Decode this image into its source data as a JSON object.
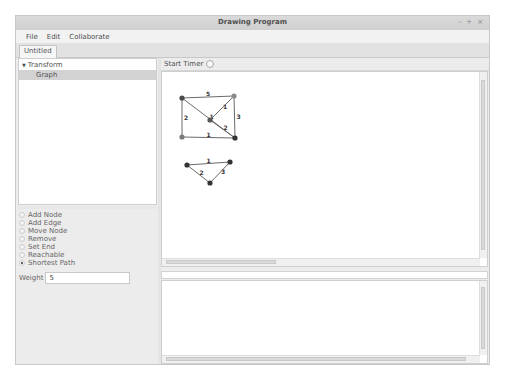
{
  "window": {
    "title": "Drawing Program",
    "controls": [
      "–",
      "+",
      "×"
    ]
  },
  "menubar": {
    "items": [
      "File",
      "Edit",
      "Collaborate"
    ]
  },
  "tabs": [
    {
      "label": "Untitled",
      "active": true
    }
  ],
  "tree": {
    "root": {
      "label": "Transform",
      "expanded": true
    },
    "children": [
      {
        "label": "Graph",
        "selected": true
      }
    ]
  },
  "tools": {
    "options": [
      {
        "label": "Add Node",
        "checked": false
      },
      {
        "label": "Add Edge",
        "checked": false
      },
      {
        "label": "Move Node",
        "checked": false
      },
      {
        "label": "Remove",
        "checked": false
      },
      {
        "label": "Set End",
        "checked": false
      },
      {
        "label": "Reachable",
        "checked": false
      },
      {
        "label": "Shortest Path",
        "checked": true
      }
    ],
    "weight_label": "Weight",
    "weight_value": "5"
  },
  "timer": {
    "label": "Start Timer",
    "on": false
  },
  "graph": {
    "nodes": [
      {
        "id": "A",
        "x": 20,
        "y": 26,
        "color": "#4a4a4a"
      },
      {
        "id": "B",
        "x": 72,
        "y": 24,
        "color": "#8a8a8a"
      },
      {
        "id": "C",
        "x": 48,
        "y": 48,
        "color": "#555555"
      },
      {
        "id": "D",
        "x": 20,
        "y": 65,
        "color": "#7a7a7a"
      },
      {
        "id": "E",
        "x": 73,
        "y": 66,
        "color": "#333333"
      },
      {
        "id": "F",
        "x": 25,
        "y": 93,
        "color": "#333333"
      },
      {
        "id": "G",
        "x": 68,
        "y": 90,
        "color": "#333333"
      },
      {
        "id": "H",
        "x": 48,
        "y": 111,
        "color": "#333333"
      }
    ],
    "edges": [
      {
        "from": "A",
        "to": "B",
        "weight": "5"
      },
      {
        "from": "A",
        "to": "E",
        "weight": "1"
      },
      {
        "from": "A",
        "to": "D",
        "weight": "2"
      },
      {
        "from": "B",
        "to": "C",
        "weight": "1"
      },
      {
        "from": "B",
        "to": "E",
        "weight": "3"
      },
      {
        "from": "C",
        "to": "E",
        "weight": "2"
      },
      {
        "from": "D",
        "to": "E",
        "weight": "1"
      },
      {
        "from": "F",
        "to": "G",
        "weight": "1"
      },
      {
        "from": "F",
        "to": "H",
        "weight": "2"
      },
      {
        "from": "G",
        "to": "H",
        "weight": "3"
      }
    ]
  }
}
